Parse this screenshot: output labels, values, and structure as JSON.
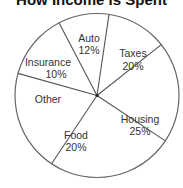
{
  "chart_data": {
    "type": "pie",
    "title": "How Income is Spent",
    "categories": [
      "Auto",
      "Taxes",
      "Housing",
      "Food",
      "Other",
      "Insurance"
    ],
    "values": [
      12,
      20,
      25,
      20,
      13,
      10
    ],
    "labels": [
      {
        "name": "Auto",
        "pct": "12%"
      },
      {
        "name": "Taxes",
        "pct": "20%"
      },
      {
        "name": "Housing",
        "pct": "25%"
      },
      {
        "name": "Food",
        "pct": "20%"
      },
      {
        "name": "Other",
        "pct": ""
      },
      {
        "name": "Insurance",
        "pct": "10%"
      }
    ],
    "start_angle_deg_clockwise_from_top": 8.4,
    "legend": "none",
    "colors": {
      "fill": "#ffffff",
      "stroke": "#555555",
      "text": "#333333"
    }
  }
}
